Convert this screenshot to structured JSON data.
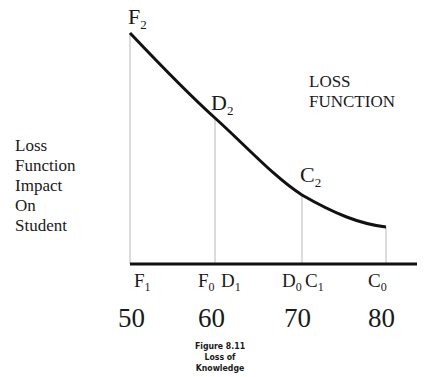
{
  "diagram": {
    "title": "LOSS FUNCTION",
    "title_lines": [
      "LOSS",
      "FUNCTION"
    ],
    "y_axis_label_lines": [
      "Loss",
      "Function",
      "Impact",
      "On",
      "Student"
    ],
    "curve_points": {
      "F2": {
        "main": "F",
        "sub": "2"
      },
      "D2": {
        "main": "D",
        "sub": "2"
      },
      "C2": {
        "main": "C",
        "sub": "2"
      }
    },
    "axis_points": {
      "F1": {
        "main": "F",
        "sub": "1"
      },
      "F0": {
        "main": "F",
        "sub": "0"
      },
      "D1": {
        "main": "D",
        "sub": "1"
      },
      "D0": {
        "main": "D",
        "sub": "0"
      },
      "C1": {
        "main": "C",
        "sub": "1"
      },
      "C0": {
        "main": "C",
        "sub": "0"
      }
    },
    "x_ticks": [
      "50",
      "60",
      "70",
      "80"
    ],
    "caption": {
      "figure": "Figure 8.11",
      "title": "Loss of Knowledge"
    },
    "colors": {
      "curve": "#111111",
      "axis": "#111111",
      "guides": "#b8b8b8",
      "text": "#1a1a1a"
    }
  }
}
